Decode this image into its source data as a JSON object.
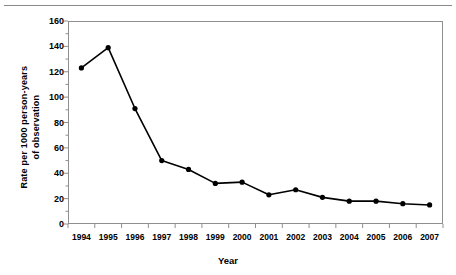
{
  "chart_data": {
    "type": "line",
    "title": "",
    "xlabel": "Year",
    "ylabel": "Rate per 1000 person-years of observation",
    "ylabel_lines": [
      "Rate per 1000 person-years",
      "of observation"
    ],
    "categories": [
      "1994",
      "1995",
      "1996",
      "1997",
      "1998",
      "1999",
      "2000",
      "2001",
      "2002",
      "2003",
      "2004",
      "2005",
      "2006",
      "2007"
    ],
    "values": [
      123,
      139,
      91,
      50,
      43,
      32,
      33,
      23,
      27,
      21,
      18,
      18,
      16,
      15
    ],
    "series": [
      {
        "name": "Rate",
        "values": [
          123,
          139,
          91,
          50,
          43,
          32,
          33,
          23,
          27,
          21,
          18,
          18,
          16,
          15
        ]
      }
    ],
    "ylim": [
      0,
      160
    ],
    "yticks": [
      0,
      20,
      40,
      60,
      80,
      100,
      120,
      140,
      160
    ],
    "ytick_labels": [
      "0",
      "20",
      "40",
      "60",
      "80",
      "100",
      "120",
      "140",
      "160"
    ],
    "minor_tick_step": 10,
    "xlim_categories": 14,
    "grid": false,
    "legend": null,
    "marker": "filled-circle",
    "line_color": "#000000",
    "marker_color": "#000000",
    "axis_color": "#8f8f8f",
    "background": "#ffffff"
  },
  "figure": {
    "top_rule": true
  }
}
